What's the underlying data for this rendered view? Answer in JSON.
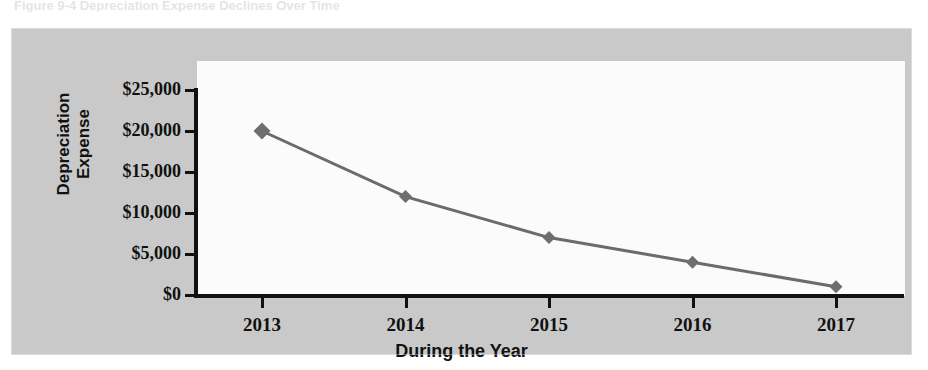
{
  "scan": {
    "title_remnant": "Figure 9-4  Depreciation Expense Declines Over Time",
    "bleed_text_1": "Fixed Asset",
    "bleed_text_2": "Book Value"
  },
  "chart_data": {
    "type": "line",
    "title": "",
    "xlabel": "During the Year",
    "ylabel": "Depreciation Expense",
    "ylabel_lines": [
      "Depreciation",
      "Expense"
    ],
    "categories": [
      "2013",
      "2014",
      "2015",
      "2016",
      "2017"
    ],
    "values": [
      20000,
      12000,
      7000,
      4000,
      1000
    ],
    "y_tick_labels": [
      "$25,000",
      "$20,000",
      "$15,000",
      "$10,000",
      "$5,000",
      "$0"
    ],
    "y_tick_values": [
      25000,
      20000,
      15000,
      10000,
      5000,
      0
    ],
    "ylim": [
      0,
      25000
    ],
    "grid": false,
    "legend": false,
    "series": [
      {
        "name": "Depreciation Expense",
        "values": [
          20000,
          12000,
          7000,
          4000,
          1000
        ],
        "marker": "diamond",
        "line_color": "#6b6b6b",
        "marker_color": "#6e6e6e"
      }
    ],
    "colors": {
      "frame_background": "#c9c9c9",
      "plot_background": "#fbfbfb",
      "axis": "#111111",
      "line": "#6b6b6b",
      "marker": "#6e6e6e"
    }
  }
}
